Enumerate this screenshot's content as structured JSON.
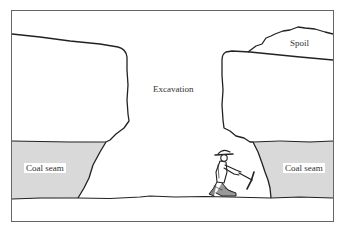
{
  "diagram": {
    "colors": {
      "background": "#ffffff",
      "frame": "#555555",
      "outline": "#222222",
      "coal_seam_fill": "#d9d9d9"
    },
    "labels": {
      "excavation": "Excavation",
      "spoil": "Spoil",
      "coal_seam_left": "Coal seam",
      "coal_seam_right": "Coal seam"
    },
    "figures": {
      "miner": "miner-with-pickaxe-icon"
    }
  }
}
